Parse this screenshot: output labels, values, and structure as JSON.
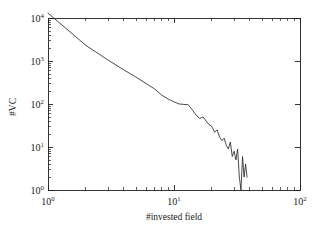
{
  "chart_data": {
    "type": "line",
    "title": "",
    "xlabel": "#invested field",
    "ylabel": "#VC",
    "xscale": "log",
    "yscale": "log",
    "xlim": [
      1,
      100
    ],
    "ylim": [
      1,
      10000
    ],
    "grid": false,
    "legend": null,
    "xticks": [
      {
        "value": 1,
        "label_base": "10",
        "label_exp": "0"
      },
      {
        "value": 10,
        "label_base": "10",
        "label_exp": "1"
      },
      {
        "value": 100,
        "label_base": "10",
        "label_exp": "2"
      }
    ],
    "yticks": [
      {
        "value": 1,
        "label_base": "10",
        "label_exp": "0"
      },
      {
        "value": 10,
        "label_base": "10",
        "label_exp": "1"
      },
      {
        "value": 100,
        "label_base": "10",
        "label_exp": "2"
      },
      {
        "value": 1000,
        "label_base": "10",
        "label_exp": "3"
      },
      {
        "value": 10000,
        "label_base": "10",
        "label_exp": "4"
      }
    ],
    "series": [
      {
        "name": "VC count by number of invested fields",
        "color": "#2b2b2b",
        "x": [
          1,
          2,
          3,
          4,
          5,
          6,
          7,
          8,
          9,
          10,
          11,
          12,
          13,
          14,
          15,
          16,
          17,
          18,
          19,
          20,
          21,
          22,
          23,
          24,
          25,
          26,
          27,
          28,
          29,
          30,
          31,
          32,
          33,
          34,
          35,
          36,
          37,
          38
        ],
        "y": [
          13000,
          2300,
          1050,
          620,
          420,
          300,
          225,
          160,
          130,
          112,
          100,
          98,
          96,
          72,
          55,
          46,
          50,
          40,
          33,
          30,
          22,
          25,
          17,
          14,
          16,
          11,
          9,
          13,
          6,
          8,
          5,
          9,
          2,
          1,
          6,
          2,
          4,
          2
        ]
      }
    ]
  },
  "axis": {
    "x_title": "#invested field",
    "y_title": "#VC"
  }
}
